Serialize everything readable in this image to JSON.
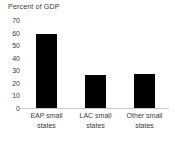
{
  "chart_data": {
    "type": "bar",
    "title": "Percent of GDP",
    "xlabel": "",
    "ylabel": "",
    "categories": [
      "EAP small states",
      "LAC small states",
      "Other small states"
    ],
    "values": [
      58.7,
      26,
      27
    ],
    "ylim": [
      0,
      70
    ],
    "yticks": [
      0,
      10,
      20,
      30,
      40,
      50,
      60,
      70
    ],
    "ytick_labels": [
      "0",
      "10",
      "20",
      "30",
      "40",
      "50",
      "60",
      "70"
    ],
    "grid": false,
    "legend": null,
    "bar_color": "#000000",
    "axis_color": "#c9c9c9",
    "text_color": "#3b3b3b",
    "background": "#ffffff"
  },
  "labels": {
    "cat0_line0": "EAP small",
    "cat0_line1": "states",
    "cat1_line0": "LAC small",
    "cat1_line1": "states",
    "cat2_line0": "Other small",
    "cat2_line1": "states"
  },
  "yticks": {
    "t70": "70",
    "t60": "60",
    "t50": "50",
    "t40": "40",
    "t30": "30",
    "t20": "20",
    "t10": "10",
    "t0": "0"
  }
}
